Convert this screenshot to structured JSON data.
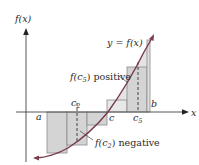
{
  "figure": {
    "type": "riemann-sum-diagram",
    "axes": {
      "y_label": "f(x)",
      "x_label": "x"
    },
    "curve_label": "y = f(x)",
    "points": {
      "a": "a",
      "b": "b",
      "c": "c",
      "c2": "c",
      "c2_sub": "2",
      "c5": "c",
      "c5_sub": "5"
    },
    "annotations": {
      "positive": {
        "prefix": "f(c",
        "sub": "5",
        "suffix": ") positive"
      },
      "negative": {
        "prefix": "f(c",
        "sub": "2",
        "suffix": ") negative"
      }
    },
    "colors": {
      "rect_fill": "#d9d9d9",
      "curve": "#7a3b4b",
      "axis": "#333333",
      "rect_stroke": "#888888",
      "shade": "#cfcfcf"
    }
  }
}
